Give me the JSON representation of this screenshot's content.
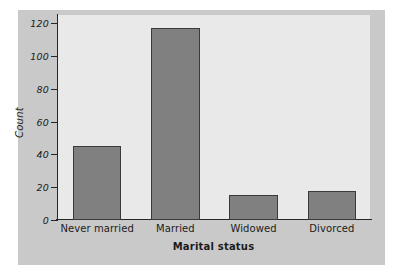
{
  "chart_data": {
    "type": "bar",
    "title": "",
    "xlabel": "Marital status",
    "ylabel": "Count",
    "categories": [
      "Never married",
      "Married",
      "Widowed",
      "Divorced"
    ],
    "values": [
      45,
      117,
      15,
      17.5
    ],
    "ylim": [
      0,
      125
    ],
    "yticks": [
      0,
      20,
      40,
      60,
      80,
      100,
      120
    ],
    "ytick_labels": [
      "0",
      "20",
      "40",
      "60",
      "80",
      "100",
      "120"
    ],
    "grid": false,
    "legend": null,
    "bar_color": "#808080",
    "bar_edge_color": "#3a3a3a",
    "panel_color": "#e9e9e9",
    "figure_color": "#c9c9c9",
    "axis_color": "#262626"
  }
}
